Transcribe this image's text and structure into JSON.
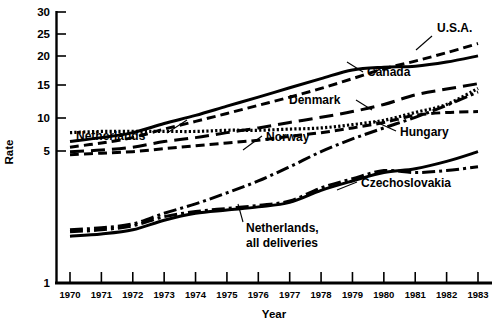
{
  "chart_data": {
    "type": "line",
    "title": "",
    "xlabel": "Year",
    "ylabel": "Rate",
    "yscale": "log",
    "ylim": [
      1,
      30
    ],
    "yticks": [
      1,
      5,
      10,
      15,
      20,
      25,
      30
    ],
    "ytick_labels": [
      "1",
      "5",
      "10",
      "15",
      "20",
      "25",
      "30"
    ],
    "grid": false,
    "legend": "inline-annotations",
    "x": [
      1970,
      1971,
      1972,
      1973,
      1974,
      1975,
      1976,
      1977,
      1978,
      1979,
      1980,
      1981,
      1982,
      1983
    ],
    "xtick_labels": [
      "1970",
      "1971",
      "1972",
      "1973",
      "1974",
      "1975",
      "1976",
      "1977",
      "1978",
      "1979",
      "1980",
      "1981",
      "1982",
      "1983"
    ],
    "series": [
      {
        "name": "U.S.A.",
        "style": "dashed",
        "values": [
          5.5,
          5.8,
          6.2,
          6.9,
          7.6,
          8.4,
          9.3,
          10.3,
          11.5,
          13.0,
          14.7,
          16.2,
          18.0,
          20.2
        ]
      },
      {
        "name": "Canada",
        "style": "solid",
        "values": [
          5.9,
          6.2,
          6.6,
          7.4,
          8.2,
          9.2,
          10.3,
          11.6,
          13.0,
          14.5,
          15.0,
          15.2,
          16.0,
          17.3
        ]
      },
      {
        "name": "Denmark",
        "style": "long-dash",
        "values": [
          5.2,
          5.3,
          5.5,
          5.9,
          6.2,
          6.6,
          7.0,
          7.5,
          8.0,
          8.6,
          9.4,
          10.6,
          11.4,
          12.2
        ]
      },
      {
        "name": "Hungary",
        "style": "dotted",
        "values": [
          6.6,
          6.7,
          6.7,
          6.7,
          6.7,
          6.8,
          6.8,
          6.9,
          7.0,
          7.3,
          7.7,
          8.5,
          9.4,
          11.5
        ]
      },
      {
        "name": "Netherlands",
        "style": "dashed",
        "values": [
          5.0,
          5.1,
          5.2,
          5.4,
          5.6,
          5.8,
          6.0,
          6.3,
          6.6,
          7.0,
          7.5,
          8.2,
          8.5,
          8.6
        ]
      },
      {
        "name": "Norway",
        "style": "dash-dot",
        "values": [
          1.95,
          2.0,
          2.1,
          2.4,
          2.7,
          3.1,
          3.6,
          4.3,
          5.2,
          6.1,
          7.0,
          8.0,
          9.3,
          11.0
        ]
      },
      {
        "name": "Czechoslovakia",
        "style": "dash-dot",
        "values": [
          1.9,
          1.95,
          2.05,
          2.3,
          2.45,
          2.55,
          2.65,
          2.8,
          3.3,
          3.7,
          4.1,
          4.0,
          4.1,
          4.3
        ]
      },
      {
        "name": "Netherlands, all deliveries",
        "style": "solid",
        "values": [
          1.8,
          1.85,
          1.95,
          2.2,
          2.4,
          2.5,
          2.6,
          2.75,
          3.2,
          3.6,
          4.0,
          4.2,
          4.6,
          5.2
        ]
      }
    ],
    "annotations": [
      {
        "text": "U.S.A.",
        "series": "U.S.A."
      },
      {
        "text": "Canada",
        "series": "Canada"
      },
      {
        "text": "Denmark",
        "series": "Denmark"
      },
      {
        "text": "Hungary",
        "series": "Hungary"
      },
      {
        "text": "Netherlands",
        "series": "Netherlands"
      },
      {
        "text": "Norway",
        "series": "Norway"
      },
      {
        "text": "Czechoslovakia",
        "series": "Czechoslovakia"
      },
      {
        "text": "Netherlands,",
        "series": "Netherlands, all deliveries"
      },
      {
        "text": "all deliveries",
        "series": "Netherlands, all deliveries"
      }
    ]
  }
}
